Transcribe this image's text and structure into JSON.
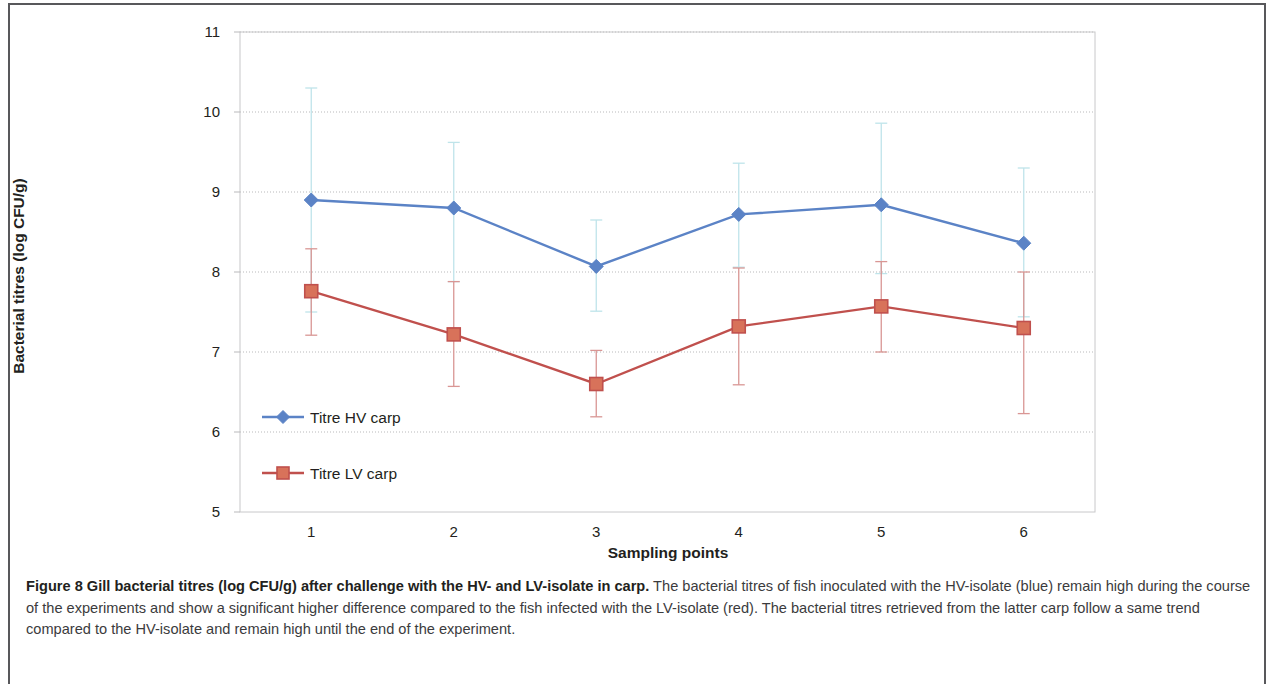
{
  "figure": {
    "caption_bold": "Figure 8 Gill bacterial titres (log CFU/g) after challenge with the HV- and LV-isolate in carp.",
    "caption_body": " The bacterial titres of fish inoculated with the HV-isolate (blue) remain high during the course of the experiments and show a significant higher difference compared to the fish infected with the LV-isolate (red). The bacterial titres retrieved from the latter carp follow a same trend compared to the HV-isolate and remain high until the end of the experiment."
  },
  "chart_data": {
    "type": "line",
    "title": "",
    "xlabel": "Sampling points",
    "ylabel": "Bacterial titres (log CFU/g)",
    "categories": [
      "1",
      "2",
      "3",
      "4",
      "5",
      "6"
    ],
    "x": [
      1,
      2,
      3,
      4,
      5,
      6
    ],
    "ylim": [
      5,
      11
    ],
    "yticks": [
      5,
      6,
      7,
      8,
      9,
      10,
      11
    ],
    "ytick_labels": [
      "5",
      "6",
      "7",
      "8",
      "9",
      "10",
      "11"
    ],
    "xtick_labels": [
      "1",
      "2",
      "3",
      "4",
      "5",
      "6"
    ],
    "grid": "horizontal",
    "legend_position": "inside-lower-left",
    "series": [
      {
        "name": "Titre HV carp",
        "color": "#5b83c6",
        "error_color": "#bfe4ea",
        "marker": "diamond",
        "values": [
          8.9,
          8.8,
          8.07,
          8.72,
          8.84,
          8.36
        ],
        "err_upper": [
          10.3,
          9.62,
          8.65,
          9.36,
          9.86,
          9.3
        ],
        "err_lower": [
          7.5,
          7.88,
          7.51,
          8.06,
          7.98,
          7.44
        ]
      },
      {
        "name": "Titre LV carp",
        "color": "#c0504d",
        "error_color": "#d99694",
        "marker": "square",
        "values": [
          7.76,
          7.22,
          6.6,
          7.32,
          7.57,
          7.3
        ],
        "err_upper": [
          8.29,
          7.88,
          7.02,
          8.05,
          8.13,
          8.0
        ],
        "err_lower": [
          7.21,
          6.57,
          6.19,
          6.59,
          7.0,
          6.23
        ]
      }
    ]
  }
}
